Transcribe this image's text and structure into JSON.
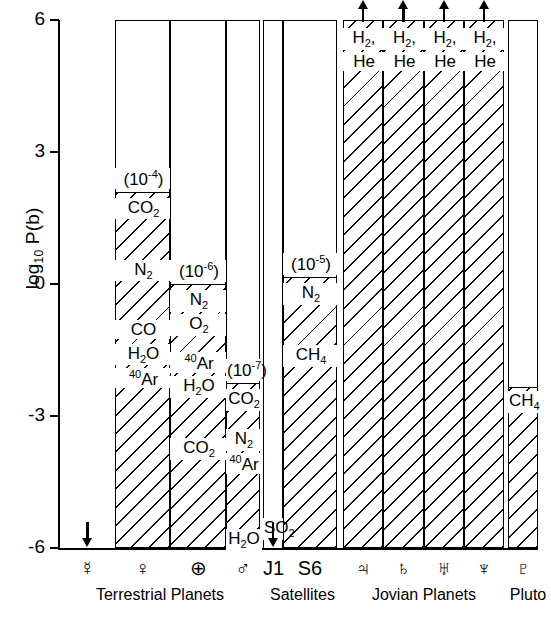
{
  "chart_data": {
    "type": "bar",
    "title": "",
    "ylabel": "log10 P(b)",
    "ylabel_base": "log",
    "ylabel_sub": "10",
    "ylabel_rest": " P(b)",
    "ylim": [
      -6,
      6
    ],
    "yticks": [
      6,
      3,
      0,
      -3,
      -6
    ],
    "ytick_labels": [
      "6",
      "3",
      "0",
      "-3",
      "-6"
    ],
    "grid": false,
    "legend": "none",
    "xlabel": "",
    "categories": [
      "☿",
      "♀",
      "⊕",
      "♂",
      "J1",
      "S6",
      "♃",
      "♄",
      "♅",
      "♆",
      "♇"
    ],
    "groups": [
      {
        "label": "Terrestrial Planets",
        "members": [
          "☿",
          "♀",
          "⊕",
          "♂"
        ]
      },
      {
        "label": "Satellites",
        "members": [
          "J1",
          "S6"
        ]
      },
      {
        "label": "Jovian Planets",
        "members": [
          "♃",
          "♄",
          "♅",
          "♆"
        ]
      },
      {
        "label": "Pluto",
        "members": [
          "♇"
        ]
      }
    ],
    "bars": [
      {
        "name": "Mercury",
        "symbol": "☿",
        "symbol_name": "mercury-symbol",
        "top": -6,
        "bottom": -6,
        "hatched": false,
        "surface_pressure_label": "",
        "species": [],
        "arrow": "down",
        "arrow_note": "upper limit",
        "outline_to_top": false
      },
      {
        "name": "Venus",
        "symbol": "♀",
        "symbol_name": "venus-symbol",
        "top": 2.1,
        "bottom": -6,
        "hatched": true,
        "surface_pressure_label": "(10⁻⁴)",
        "surface_pressure_mantissa": "(10",
        "surface_pressure_exp": "-4",
        "surface_pressure_close": ")",
        "species": [
          "CO2",
          "N2",
          "CO",
          "H2O",
          "40Ar"
        ],
        "species_display": [
          {
            "text": "CO",
            "sub": "2"
          },
          {
            "text": "N",
            "sub": "2"
          },
          {
            "text": "CO",
            "sub": ""
          },
          {
            "text": "H",
            "sub": "2",
            "tail": "O"
          },
          {
            "pre": "40",
            "text": "Ar",
            "sub": ""
          }
        ],
        "arrow": "none",
        "outline_to_top": true
      },
      {
        "name": "Earth",
        "symbol": "⊕",
        "symbol_name": "earth-symbol",
        "top": 0.0,
        "bottom": -6,
        "hatched": true,
        "surface_pressure_label": "(10⁻⁶)",
        "surface_pressure_mantissa": "(10",
        "surface_pressure_exp": "-6",
        "surface_pressure_close": ")",
        "species": [
          "N2",
          "O2",
          "40Ar",
          "H2O",
          "CO2"
        ],
        "species_display": [
          {
            "text": "N",
            "sub": "2"
          },
          {
            "text": "O",
            "sub": "2"
          },
          {
            "pre": "40",
            "text": "Ar",
            "sub": ""
          },
          {
            "text": "H",
            "sub": "2",
            "tail": "O"
          },
          {
            "text": "CO",
            "sub": "2"
          }
        ],
        "arrow": "none",
        "outline_to_top": true
      },
      {
        "name": "Mars",
        "symbol": "♂",
        "symbol_name": "mars-symbol",
        "top": -2.25,
        "bottom": -6,
        "hatched": true,
        "surface_pressure_label": "(10⁻⁷)",
        "surface_pressure_mantissa": "(10",
        "surface_pressure_exp": "-7",
        "surface_pressure_close": ")",
        "species": [
          "CO2",
          "N2",
          "40Ar",
          "H2O"
        ],
        "species_display": [
          {
            "text": "CO",
            "sub": "2"
          },
          {
            "text": "N",
            "sub": "2"
          },
          {
            "pre": "40",
            "text": "Ar",
            "sub": ""
          },
          {
            "text": "H",
            "sub": "2",
            "tail": "O"
          }
        ],
        "arrow": "none",
        "outline_to_top": true
      },
      {
        "name": "Io",
        "symbol": "J1",
        "symbol_name": "io-label",
        "top": -6,
        "bottom": -6,
        "hatched": false,
        "surface_pressure_label": "",
        "species": [
          "SO2"
        ],
        "species_display": [
          {
            "text": "SO",
            "sub": "2"
          }
        ],
        "arrow": "down",
        "arrow_note": "upper limit",
        "outline_to_top": true
      },
      {
        "name": "Titan",
        "symbol": "S6",
        "symbol_name": "titan-label",
        "top": 0.15,
        "bottom": -6,
        "hatched": true,
        "surface_pressure_label": "(10⁻⁵)",
        "surface_pressure_mantissa": "(10",
        "surface_pressure_exp": "-5",
        "surface_pressure_close": ")",
        "species": [
          "N2",
          "CH4"
        ],
        "species_display": [
          {
            "text": "N",
            "sub": "2"
          },
          {
            "text": "CH",
            "sub": "4"
          }
        ],
        "arrow": "none",
        "outline_to_top": true
      },
      {
        "name": "Jupiter",
        "symbol": "♃",
        "symbol_name": "jupiter-symbol",
        "top": 6,
        "bottom": -6,
        "hatched": true,
        "surface_pressure_label": "",
        "species": [
          "H2",
          "He"
        ],
        "species_display": [
          {
            "text": "H",
            "sub": "2",
            "tail": ","
          },
          {
            "text": "He",
            "sub": ""
          }
        ],
        "arrow": "up",
        "arrow_note": "extends beyond axis",
        "outline_to_top": true
      },
      {
        "name": "Saturn",
        "symbol": "♄",
        "symbol_name": "saturn-symbol",
        "top": 6,
        "bottom": -6,
        "hatched": true,
        "surface_pressure_label": "",
        "species": [
          "H2",
          "He"
        ],
        "species_display": [
          {
            "text": "H",
            "sub": "2",
            "tail": ","
          },
          {
            "text": "He",
            "sub": ""
          }
        ],
        "arrow": "up",
        "arrow_note": "extends beyond axis",
        "outline_to_top": true
      },
      {
        "name": "Uranus",
        "symbol": "♅",
        "symbol_name": "uranus-symbol",
        "top": 6,
        "bottom": -6,
        "hatched": true,
        "surface_pressure_label": "",
        "species": [
          "H2",
          "He"
        ],
        "species_display": [
          {
            "text": "H",
            "sub": "2",
            "tail": ","
          },
          {
            "text": "He",
            "sub": ""
          }
        ],
        "arrow": "up",
        "arrow_note": "extends beyond axis",
        "outline_to_top": true
      },
      {
        "name": "Neptune",
        "symbol": "♆",
        "symbol_name": "neptune-symbol",
        "top": 6,
        "bottom": -6,
        "hatched": true,
        "surface_pressure_label": "",
        "species": [
          "H2",
          "He"
        ],
        "species_display": [
          {
            "text": "H",
            "sub": "2",
            "tail": ","
          },
          {
            "text": "He",
            "sub": ""
          }
        ],
        "arrow": "up",
        "arrow_note": "extends beyond axis",
        "outline_to_top": true
      },
      {
        "name": "Pluto",
        "symbol": "♇",
        "symbol_name": "pluto-symbol",
        "top": -2.35,
        "bottom": -6,
        "hatched": true,
        "surface_pressure_label": "",
        "species": [
          "CH4"
        ],
        "species_display": [
          {
            "text": "CH",
            "sub": "4"
          }
        ],
        "arrow": "none",
        "outline_to_top": true
      }
    ]
  },
  "colors": {
    "ink": "#000000",
    "paper": "#ffffff"
  }
}
